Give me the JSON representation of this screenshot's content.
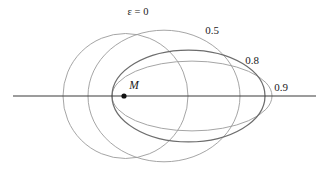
{
  "figure": {
    "width": 327,
    "height": 186,
    "background_color": "#ffffff"
  },
  "chart_data": {
    "type": "line",
    "title": "",
    "xlabel": "",
    "ylabel": "",
    "grid": false,
    "legend_position": "inline-annotations",
    "axis": {
      "name": "major-axis-line",
      "x_start": 13,
      "x_end": 316,
      "y": 96,
      "color": "#3a3a3a",
      "width": 1.1
    },
    "focus": {
      "label": "M",
      "x": 124,
      "y": 96,
      "radius": 2.6,
      "color": "#111111",
      "label_x": 134,
      "label_y": 86
    },
    "series": [
      {
        "name": "eccentricity-0",
        "eccentricity": 0,
        "label": "ε = 0",
        "label_x": 138,
        "label_y": 13,
        "center_x": 125.5,
        "center_y": 96,
        "semi_major": 62.5,
        "semi_minor": 62.5,
        "left_vertex_x": 63,
        "right_vertex_x": 188,
        "color": "#9b9b9b",
        "width": 0.9
      },
      {
        "name": "eccentricity-0-5",
        "eccentricity": 0.5,
        "label": "0.5",
        "label_x": 212,
        "label_y": 31,
        "center_x": 164,
        "center_y": 96,
        "semi_major": 76,
        "semi_minor": 65.8,
        "left_vertex_x": 88,
        "right_vertex_x": 240,
        "color": "#9b9b9b",
        "width": 0.9
      },
      {
        "name": "eccentricity-0-8",
        "eccentricity": 0.8,
        "label": "0.8",
        "label_x": 252,
        "label_y": 61,
        "center_x": 188.5,
        "center_y": 96,
        "semi_major": 76.5,
        "semi_minor": 45.9,
        "left_vertex_x": 112,
        "right_vertex_x": 265,
        "color": "#6d6d6d",
        "width": 1.25
      },
      {
        "name": "eccentricity-0-9",
        "eccentricity": 0.9,
        "label": "0.9",
        "label_x": 281,
        "label_y": 88,
        "center_x": 192,
        "center_y": 96,
        "semi_major": 80,
        "semi_minor": 34.9,
        "left_vertex_x": 112,
        "right_vertex_x": 272,
        "color": "#9b9b9b",
        "width": 0.9
      }
    ]
  }
}
